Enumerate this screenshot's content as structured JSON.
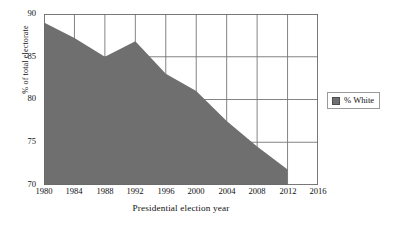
{
  "chart_data": {
    "type": "area",
    "title": "",
    "xlabel": "Presidential election year",
    "ylabel": "% of total electorate",
    "xlim": [
      1980,
      2016
    ],
    "ylim": [
      70,
      90
    ],
    "grid": true,
    "legend_position": "right",
    "x": [
      1980,
      1984,
      1988,
      1992,
      1996,
      2000,
      2004,
      2008,
      2012
    ],
    "categories": [
      "1980",
      "1984",
      "1988",
      "1992",
      "1996",
      "2000",
      "2004",
      "2008",
      "2012"
    ],
    "series": [
      {
        "name": "% White",
        "color": "#6f6f6f",
        "values": [
          89.0,
          87.2,
          85.0,
          86.8,
          83.0,
          81.0,
          77.5,
          74.5,
          71.8
        ]
      }
    ],
    "xticks": [
      "1980",
      "1984",
      "1988",
      "1992",
      "1996",
      "2000",
      "2004",
      "2008",
      "2012",
      "2016"
    ],
    "xtick_values": [
      1980,
      1984,
      1988,
      1992,
      1996,
      2000,
      2004,
      2008,
      2012,
      2016
    ],
    "yticks": [
      "70",
      "75",
      "80",
      "85",
      "90"
    ],
    "ytick_values": [
      70,
      75,
      80,
      85,
      90
    ]
  },
  "axes": {
    "y_title": "% of total electorate",
    "x_title": "Presidential election year",
    "y_ticks": [
      {
        "label": "90"
      },
      {
        "label": "85"
      },
      {
        "label": "80"
      },
      {
        "label": "75"
      },
      {
        "label": "70"
      }
    ],
    "x_ticks": [
      {
        "label": "1980"
      },
      {
        "label": "1984"
      },
      {
        "label": "1988"
      },
      {
        "label": "1992"
      },
      {
        "label": "1996"
      },
      {
        "label": "2000"
      },
      {
        "label": "2004"
      },
      {
        "label": "2008"
      },
      {
        "label": "2012"
      },
      {
        "label": "2016"
      }
    ]
  },
  "legend": {
    "entries": [
      {
        "label": "% White",
        "color": "#6f6f6f"
      }
    ]
  },
  "colors": {
    "series_fill": "#6f6f6f",
    "grid": "#767676",
    "frame": "#6a6a6a",
    "background": "#ffffff"
  }
}
